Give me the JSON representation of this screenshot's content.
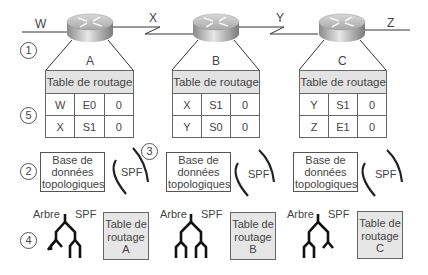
{
  "networks": [
    {
      "label": "W"
    },
    {
      "label": "X"
    },
    {
      "label": "Y"
    },
    {
      "label": "Z"
    }
  ],
  "routers": [
    {
      "name": "A",
      "table_header": "Table de routage",
      "routes": [
        {
          "net": "W",
          "iface": "E0",
          "cost": "0"
        },
        {
          "net": "X",
          "iface": "S1",
          "cost": "0"
        }
      ],
      "topo_db": [
        "Base de",
        "données",
        "topologiques"
      ],
      "spf_label": "SPF",
      "tree_labels": {
        "left": "Arbre",
        "right": "SPF"
      },
      "final_table": [
        "Table de",
        "routage",
        "A"
      ]
    },
    {
      "name": "B",
      "table_header": "Table de routage",
      "routes": [
        {
          "net": "X",
          "iface": "S1",
          "cost": "0"
        },
        {
          "net": "Y",
          "iface": "S0",
          "cost": "0"
        }
      ],
      "topo_db": [
        "Base de",
        "données",
        "topologiques"
      ],
      "spf_label": "SPF",
      "tree_labels": {
        "left": "Arbre",
        "right": "SPF"
      },
      "final_table": [
        "Table de",
        "routage",
        "B"
      ]
    },
    {
      "name": "C",
      "table_header": "Table de routage",
      "routes": [
        {
          "net": "Y",
          "iface": "S1",
          "cost": "0"
        },
        {
          "net": "Z",
          "iface": "E1",
          "cost": "0"
        }
      ],
      "topo_db": [
        "Base de",
        "données",
        "topologiques"
      ],
      "spf_label": "SPF",
      "tree_labels": {
        "left": "Arbre",
        "right": "SPF"
      },
      "final_table": [
        "Table de",
        "routage",
        "C"
      ]
    }
  ],
  "steps": [
    "1",
    "2",
    "3",
    "4",
    "5"
  ],
  "colors": {
    "line": "#333333",
    "table_header_bg": "#e3e3e3",
    "final_table_bg": "#e6e6e6"
  }
}
